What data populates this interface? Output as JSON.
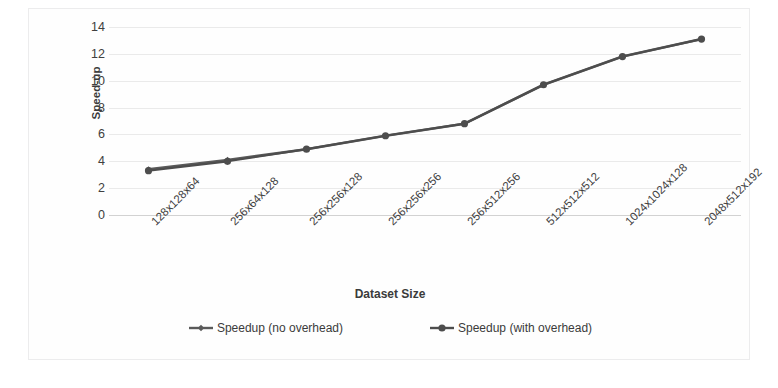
{
  "chart_data": {
    "type": "line",
    "title": "",
    "xlabel": "Dataset Size",
    "ylabel": "Speed-up",
    "categories": [
      "128x128x64",
      "256x64x128",
      "256x256x128",
      "256x256x256",
      "256x512x256",
      "512x512x512",
      "1024x1024x128",
      "2048x512x192"
    ],
    "series": [
      {
        "name": "Speedup (no overhead)",
        "color": "#5a5a5a",
        "marker": "diamond",
        "values": [
          3.4,
          4.1,
          4.9,
          5.9,
          6.8,
          9.7,
          11.8,
          13.1
        ]
      },
      {
        "name": "Speedup (with overhead)",
        "color": "#4d4d4d",
        "marker": "circle",
        "values": [
          3.3,
          4.0,
          4.9,
          5.9,
          6.8,
          9.7,
          11.8,
          13.1
        ]
      }
    ],
    "ylim": [
      0,
      14
    ],
    "yticks": [
      0,
      2,
      4,
      6,
      8,
      10,
      12,
      14
    ],
    "ytick_labels": [
      "0",
      "2",
      "4",
      "6",
      "8",
      "10",
      "12",
      "14"
    ],
    "grid": "horizontal",
    "legend_position": "bottom"
  },
  "colors": {
    "gridline": "#eaeaea",
    "axis": "#d2d2d2",
    "text": "#3b3b3b",
    "plot_background": "#fefefe",
    "border": "#ececed"
  }
}
